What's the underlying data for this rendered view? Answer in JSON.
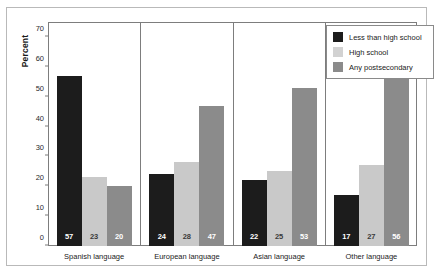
{
  "chart_data": {
    "type": "bar",
    "title": "",
    "subtitle": "",
    "xlabel": "",
    "ylabel": "Percent",
    "ylim": [
      0,
      75
    ],
    "yticks": [
      0,
      10,
      20,
      30,
      40,
      50,
      60,
      70
    ],
    "grid": false,
    "legend_position": "top-right",
    "grouping": "paneled-by-category",
    "categories": [
      "Spanish language",
      "European language",
      "Asian language",
      "Other language"
    ],
    "series": [
      {
        "name": "Less than high school",
        "color": "#1c1c1c",
        "values": [
          57,
          24,
          22,
          17
        ]
      },
      {
        "name": "High school",
        "color": "#c9c9c9",
        "values": [
          23,
          28,
          25,
          27
        ]
      },
      {
        "name": "Any postsecondary",
        "color": "#8b8b8b",
        "values": [
          20,
          47,
          53,
          56
        ]
      }
    ]
  },
  "axis": {
    "y_title": "Percent",
    "y_ticks": [
      "0",
      "10",
      "20",
      "30",
      "40",
      "50",
      "60",
      "70"
    ]
  },
  "legend": {
    "items": [
      {
        "label": "Less than high school",
        "swatch": "dark"
      },
      {
        "label": "High school",
        "swatch": "light"
      },
      {
        "label": "Any postsecondary",
        "swatch": "medium"
      }
    ]
  },
  "panels": [
    {
      "label": "Spanish language",
      "bars": [
        {
          "series": "Less than high school",
          "value": 57,
          "value_text": "57",
          "tone": "dark"
        },
        {
          "series": "High school",
          "value": 23,
          "value_text": "23",
          "tone": "light"
        },
        {
          "series": "Any postsecondary",
          "value": 20,
          "value_text": "20",
          "tone": "medium"
        }
      ]
    },
    {
      "label": "European language",
      "bars": [
        {
          "series": "Less than high school",
          "value": 24,
          "value_text": "24",
          "tone": "dark"
        },
        {
          "series": "High school",
          "value": 28,
          "value_text": "28",
          "tone": "light"
        },
        {
          "series": "Any postsecondary",
          "value": 47,
          "value_text": "47",
          "tone": "medium"
        }
      ]
    },
    {
      "label": "Asian language",
      "bars": [
        {
          "series": "Less than high school",
          "value": 22,
          "value_text": "22",
          "tone": "dark"
        },
        {
          "series": "High school",
          "value": 25,
          "value_text": "25",
          "tone": "light"
        },
        {
          "series": "Any postsecondary",
          "value": 53,
          "value_text": "53",
          "tone": "medium"
        }
      ]
    },
    {
      "label": "Other language",
      "bars": [
        {
          "series": "Less than high school",
          "value": 17,
          "value_text": "17",
          "tone": "dark"
        },
        {
          "series": "High school",
          "value": 27,
          "value_text": "27",
          "tone": "light"
        },
        {
          "series": "Any postsecondary",
          "value": 56,
          "value_text": "56",
          "tone": "medium"
        }
      ]
    }
  ]
}
